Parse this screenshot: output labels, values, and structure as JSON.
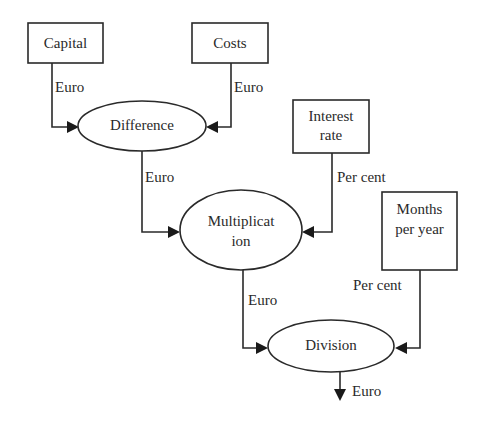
{
  "diagram": {
    "type": "data-flow",
    "inputs": [
      {
        "id": "capital",
        "label": "Capital"
      },
      {
        "id": "costs",
        "label": "Costs"
      },
      {
        "id": "interest_rate",
        "label_line1": "Interest",
        "label_line2": "rate"
      },
      {
        "id": "months_per_year",
        "label_line1": "Months",
        "label_line2": "per year"
      }
    ],
    "operations": [
      {
        "id": "difference",
        "label": "Difference"
      },
      {
        "id": "multiplication",
        "label_line1": "Multiplicat",
        "label_line2": "ion"
      },
      {
        "id": "division",
        "label": "Division"
      }
    ],
    "edges": [
      {
        "from": "capital",
        "to": "difference",
        "unit": "Euro"
      },
      {
        "from": "costs",
        "to": "difference",
        "unit": "Euro"
      },
      {
        "from": "difference",
        "to": "multiplication",
        "unit": "Euro"
      },
      {
        "from": "interest_rate",
        "to": "multiplication",
        "unit": "Per cent"
      },
      {
        "from": "multiplication",
        "to": "division",
        "unit": "Euro"
      },
      {
        "from": "months_per_year",
        "to": "division",
        "unit": "Per cent"
      },
      {
        "from": "division",
        "to": "output",
        "unit": "Euro"
      }
    ],
    "colors": {
      "stroke": "#2a2a2a",
      "background": "#ffffff"
    }
  }
}
